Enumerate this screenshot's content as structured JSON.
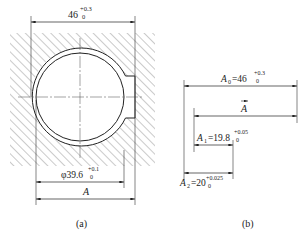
{
  "figure_a": {
    "caption": "(a)",
    "top_dim": {
      "base": "46",
      "upper": "+0.3",
      "lower": "0"
    },
    "diameter_dim": {
      "base": "φ39.6",
      "upper": "+0.1",
      "lower": "0"
    },
    "a_dim": {
      "label": "A"
    }
  },
  "figure_b": {
    "caption": "(b)",
    "a0": {
      "name": "A",
      "sub": "0",
      "eq": "=46",
      "upper": "+0.3",
      "lower": "0"
    },
    "a_vec": {
      "label": "A"
    },
    "a1": {
      "name": "A",
      "sub": "1",
      "eq": "=19.8",
      "upper": "+0.05",
      "lower": "0"
    },
    "a2": {
      "name": "A",
      "sub": "2",
      "eq": "=20",
      "upper": "+0.025",
      "lower": "0"
    }
  },
  "colors": {
    "line": "#222222",
    "hatch": "#555555",
    "background": "#ffffff"
  }
}
